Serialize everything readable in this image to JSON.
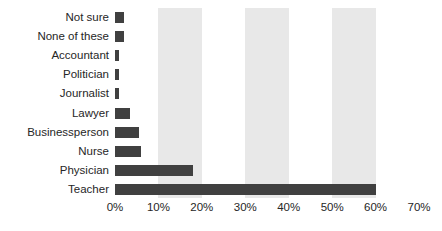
{
  "chart_data": {
    "type": "bar",
    "orientation": "horizontal",
    "title": "",
    "xlabel": "",
    "ylabel": "",
    "categories": [
      "Not sure",
      "None of these",
      "Accountant",
      "Politician",
      "Journalist",
      "Lawyer",
      "Businessperson",
      "Nurse",
      "Physician",
      "Teacher"
    ],
    "values": [
      2,
      2,
      1,
      1,
      1,
      3.5,
      5.5,
      6,
      18,
      60
    ],
    "value_suffix": "%",
    "xlim": [
      0,
      70
    ],
    "xticks": [
      0,
      10,
      20,
      30,
      40,
      50,
      60,
      70
    ],
    "xtick_labels": [
      "0%",
      "10%",
      "20%",
      "30%",
      "40%",
      "50%",
      "60%",
      "70%"
    ],
    "grid": false,
    "alternating_bands": [
      [
        10,
        20
      ],
      [
        30,
        40
      ],
      [
        50,
        60
      ]
    ],
    "legend": "none",
    "colors": {
      "bar": "#404040",
      "band": "#e8e8e8",
      "background": "#ffffff",
      "text": "#262626"
    }
  }
}
